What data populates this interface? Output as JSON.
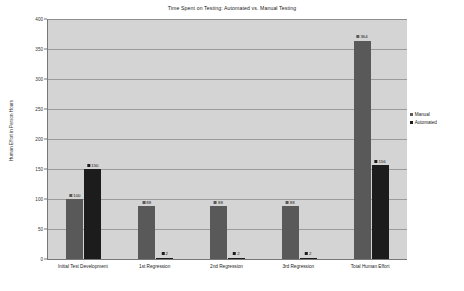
{
  "chart_data": {
    "type": "bar",
    "title": "Time Spent on Testing: Automated vs. Manual Testing",
    "xlabel": "",
    "ylabel": "Human Effort in Person Hours",
    "categories": [
      "Initial Test Development",
      "1st Regression",
      "2nd Regression",
      "3rd Regression",
      "Total Human Effort"
    ],
    "series": [
      {
        "name": "Manual",
        "color": "#595959",
        "values": [
          100,
          88,
          88,
          88,
          364
        ]
      },
      {
        "name": "Automated",
        "color": "#1c1c1c",
        "values": [
          150,
          2,
          2,
          2,
          156
        ]
      }
    ],
    "ylim": [
      0,
      400
    ],
    "yticks": [
      0,
      50,
      100,
      150,
      200,
      250,
      300,
      350,
      400
    ],
    "ytick_labels": [
      "0",
      "50",
      "100",
      "150",
      "200",
      "250",
      "300",
      "350",
      "400"
    ],
    "grid": true,
    "legend_position": "right",
    "data_labels": {
      "Manual": [
        "100",
        "88",
        "88",
        "88",
        "364"
      ],
      "Automated": [
        "150",
        "2",
        "2",
        "2",
        "156"
      ]
    },
    "plot_background": "#d4d4d4"
  },
  "legend": {
    "items": [
      {
        "label": "Manual"
      },
      {
        "label": "Automated"
      }
    ]
  }
}
